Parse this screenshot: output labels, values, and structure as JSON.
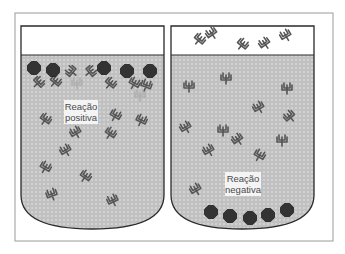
{
  "diagram": {
    "frame": {
      "x": 15,
      "y": 13,
      "w": 318,
      "h": 228,
      "stroke": "#9a9a9a"
    },
    "colors": {
      "fluid": "#c9c9c9",
      "fluid_pattern": "#a6a6a6",
      "container_stroke": "#2a2a2a",
      "particle": "#333333",
      "antibody": "#555555",
      "antibody_faded": "#b0b0b0",
      "label_bg": "#f4f4f4"
    },
    "containers": [
      {
        "id": "positive",
        "label_line1": "Reação",
        "label_line2": "positiva",
        "particles_position": "top",
        "particles": [
          [
            34,
            68
          ],
          [
            53,
            70
          ],
          [
            104,
            68
          ],
          [
            127,
            71
          ],
          [
            150,
            71
          ]
        ],
        "antibodies_top": [
          [
            38,
            83,
            45
          ],
          [
            55,
            82,
            40
          ],
          [
            72,
            72,
            -50
          ],
          [
            90,
            72,
            50
          ],
          [
            110,
            84,
            40
          ],
          [
            134,
            84,
            30
          ],
          [
            146,
            86,
            20
          ]
        ],
        "antibodies_faded": [
          [
            77,
            84,
            0
          ],
          [
            140,
            96,
            0
          ]
        ],
        "antibodies_fluid": [
          [
            45,
            120,
            35
          ],
          [
            115,
            116,
            30
          ],
          [
            141,
            121,
            25
          ],
          [
            45,
            168,
            30
          ],
          [
            76,
            133,
            -30
          ],
          [
            110,
            134,
            35
          ],
          [
            66,
            151,
            -30
          ],
          [
            85,
            177,
            35
          ],
          [
            52,
            195,
            -20
          ],
          [
            113,
            201,
            -25
          ]
        ]
      },
      {
        "id": "negative",
        "label_line1": "Reação",
        "label_line2": "negativa",
        "particles_position": "bottom",
        "particles": [
          [
            211,
            212
          ],
          [
            230,
            216
          ],
          [
            250,
            218
          ],
          [
            268,
            215
          ],
          [
            287,
            210
          ]
        ],
        "antibodies_above": [
          [
            199,
            40,
            40
          ],
          [
            212,
            34,
            -35
          ],
          [
            242,
            45,
            40
          ],
          [
            265,
            44,
            -35
          ],
          [
            286,
            36,
            -30
          ]
        ],
        "antibodies_fluid": [
          [
            189,
            87,
            0
          ],
          [
            226,
            79,
            0
          ],
          [
            287,
            89,
            0
          ],
          [
            259,
            108,
            -30
          ],
          [
            290,
            117,
            -40
          ],
          [
            186,
            128,
            -30
          ],
          [
            223,
            131,
            0
          ],
          [
            238,
            140,
            -35
          ],
          [
            209,
            151,
            -30
          ],
          [
            259,
            156,
            30
          ],
          [
            282,
            141,
            0
          ],
          [
            196,
            190,
            -30
          ]
        ]
      }
    ]
  }
}
